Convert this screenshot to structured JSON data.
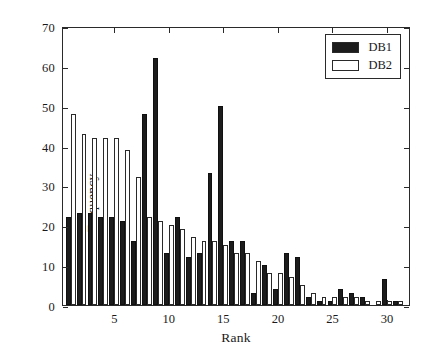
{
  "chart_data": {
    "type": "bar",
    "title": "",
    "xlabel": "Rank",
    "ylabel": "Frequency",
    "xlim": [
      0.3,
      32.2
    ],
    "ylim": [
      0,
      70
    ],
    "ytick_values": [
      0,
      10,
      20,
      30,
      40,
      50,
      60,
      70
    ],
    "ytick_labels": [
      "0",
      "10",
      "20",
      "30",
      "40",
      "50",
      "60",
      "70"
    ],
    "xtick_values": [
      5,
      10,
      15,
      20,
      25,
      30
    ],
    "xtick_labels": [
      "5",
      "10",
      "15",
      "20",
      "25",
      "30"
    ],
    "grid": false,
    "legend_position": "top-right",
    "categories": [
      1,
      2,
      3,
      4,
      5,
      6,
      7,
      8,
      9,
      10,
      11,
      12,
      13,
      14,
      15,
      16,
      17,
      18,
      19,
      20,
      21,
      22,
      23,
      24,
      25,
      26,
      27,
      28,
      29,
      30,
      31
    ],
    "series": [
      {
        "name": "DB1",
        "color": "#1c1c1c",
        "values": [
          22,
          23,
          23,
          22,
          22,
          21,
          16,
          48,
          62,
          13,
          22,
          12,
          13,
          33,
          50,
          16,
          16,
          3,
          10,
          4,
          13,
          12,
          2,
          1,
          1,
          4,
          3,
          2,
          0,
          6.5,
          1
        ]
      },
      {
        "name": "DB2",
        "color": "#ffffff",
        "values": [
          48,
          43,
          42,
          42,
          42,
          39,
          32,
          22,
          21,
          20,
          19,
          17,
          16,
          16,
          15,
          13,
          13,
          11,
          8,
          8,
          7,
          5,
          3,
          2,
          2,
          2,
          2,
          1,
          1,
          1,
          1
        ]
      }
    ]
  },
  "legend": {
    "items": [
      {
        "label": "DB1",
        "style": "filled"
      },
      {
        "label": "DB2",
        "style": "outline"
      }
    ]
  }
}
